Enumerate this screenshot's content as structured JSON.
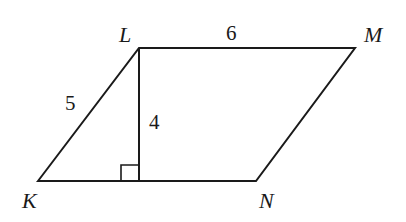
{
  "diagram": {
    "type": "parallelogram",
    "vertices": [
      {
        "name": "K",
        "label": "K"
      },
      {
        "name": "L",
        "label": "L"
      },
      {
        "name": "M",
        "label": "M"
      },
      {
        "name": "N",
        "label": "N"
      }
    ],
    "measurements": {
      "side_KL": "5",
      "side_LM": "6",
      "height": "4"
    },
    "annotations": [
      "right-angle at foot of altitude from L to KN"
    ],
    "stroke_color": "#1a1a1a"
  }
}
